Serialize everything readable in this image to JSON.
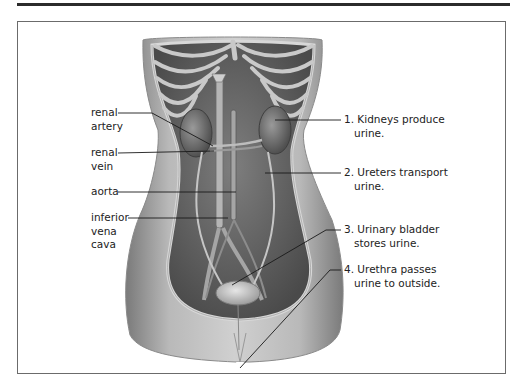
{
  "figure": {
    "type": "anatomical illustration",
    "colors": {
      "rule": "#2b2b2b",
      "frame": "#6b6b6b",
      "leader": "#1a1a1a",
      "tissue_dark": "#555555",
      "tissue_mid": "#8a8a8a",
      "tissue_light": "#c8c8c8"
    }
  },
  "left_labels": [
    {
      "id": "renal-artery",
      "lines": [
        "renal",
        "artery"
      ]
    },
    {
      "id": "renal-vein",
      "lines": [
        "renal",
        "vein"
      ]
    },
    {
      "id": "aorta",
      "lines": [
        "aorta"
      ]
    },
    {
      "id": "inferior-vena-cava",
      "lines": [
        "inferior",
        "vena",
        "cava"
      ]
    }
  ],
  "right_labels": [
    {
      "id": "kidneys",
      "line1": "1. Kidneys produce",
      "line2": "urine."
    },
    {
      "id": "ureters",
      "line1": "2. Ureters transport",
      "line2": "urine."
    },
    {
      "id": "bladder",
      "line1": "3. Urinary bladder",
      "line2": "stores urine."
    },
    {
      "id": "urethra",
      "line1": "4. Urethra passes",
      "line2": "urine to outside."
    }
  ]
}
